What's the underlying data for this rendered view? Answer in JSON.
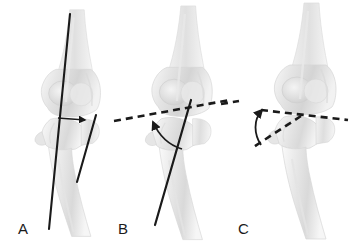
{
  "figure": {
    "background_color": "#ffffff",
    "line_color": "#1a1a1a",
    "bone_fill_light": "#f4f4f4",
    "bone_fill_mid": "#e2e2e2",
    "bone_fill_shadow": "#c9c9c9",
    "bone_outline": "#d8d8d8",
    "width": 350,
    "height": 247
  },
  "panels": [
    {
      "id": "A",
      "label": "A",
      "label_x": 18,
      "label_y": 234,
      "description": "Lateral elbow with two solid intersecting axis lines and a small straight arrow marking the angle between the humeral shaft axis and the proximal forearm line",
      "annotations": [
        {
          "name": "humeral-shaft-axis-line",
          "style": "solid",
          "x1": 70,
          "y1": 14,
          "x2": 49,
          "y2": 229
        },
        {
          "name": "proximal-forearm-axis-line",
          "style": "solid",
          "x1": 95,
          "y1": 116,
          "x2": 78,
          "y2": 181
        },
        {
          "name": "angle-arrow",
          "style": "solid-arrow",
          "x1": 57,
          "y1": 119,
          "x2": 84,
          "y2": 120
        }
      ]
    },
    {
      "id": "B",
      "label": "B",
      "label_x": 118,
      "label_y": 234,
      "description": "Lateral elbow with a dashed transcondylar reference line, a solid ulnar shaft axis line and a curved arrow sweeping the included angle",
      "annotations": [
        {
          "name": "transcondylar-reference-line",
          "style": "dashed",
          "x1": 114,
          "y1": 121,
          "x2": 229,
          "y2": 100
        },
        {
          "name": "ulnar-shaft-axis-line",
          "style": "solid",
          "x1": 190,
          "y1": 101,
          "x2": 155,
          "y2": 224
        },
        {
          "name": "angle-arc-arrow",
          "style": "curved-arrow",
          "from_x": 178,
          "from_y": 147,
          "to_x": 152,
          "to_y": 117
        }
      ]
    },
    {
      "id": "C",
      "label": "C",
      "label_x": 238,
      "label_y": 234,
      "description": "Lateral elbow with two dashed lines meeting at a vertex on the joint line plus a short dashed fragment at far left and a curved arrow indicating the measured angle",
      "annotations": [
        {
          "name": "joint-line-dashed",
          "style": "dashed",
          "x1": 262,
          "y1": 110,
          "x2": 347,
          "y2": 120
        },
        {
          "name": "oblique-dashed-line",
          "style": "dashed",
          "x1": 300,
          "y1": 115,
          "x2": 253,
          "y2": 147
        },
        {
          "name": "dashed-fragment-left",
          "style": "dashed",
          "x1": 222,
          "y1": 103,
          "x2": 238,
          "y2": 101
        },
        {
          "name": "angle-arc-arrow",
          "style": "curved-arrow",
          "from_x": 259,
          "from_y": 142,
          "to_x": 263,
          "to_y": 108
        }
      ]
    }
  ]
}
